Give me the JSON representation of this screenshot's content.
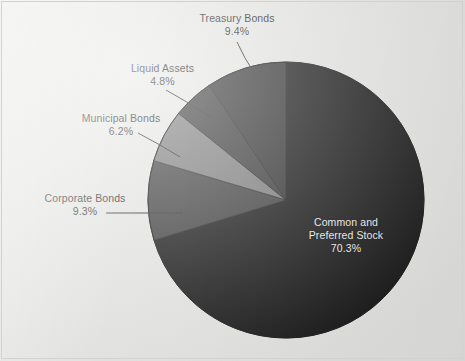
{
  "figure": {
    "background_color": "#e6e6e4",
    "border_color": "#d2d2d0",
    "width": 465,
    "height": 361
  },
  "chart_data": {
    "type": "pie",
    "title": "",
    "subtitle": "",
    "xlabel": "",
    "ylabel": "",
    "grid": false,
    "legend_position": "none",
    "label_format": "name + percent",
    "start_angle_deg": 90,
    "direction": "clockwise",
    "center": {
      "x": 286,
      "y": 200
    },
    "radius": 138,
    "categories": [
      "Common and Preferred Stock",
      "Corporate Bonds",
      "Municipal Bonds",
      "Liquid Assets",
      "Treasury Bonds"
    ],
    "values": [
      70.3,
      9.3,
      6.2,
      4.8,
      9.4
    ],
    "units": "percent",
    "total": 100.0,
    "slices": [
      {
        "label": "Common and Preferred Stock",
        "label_line1": "Common and",
        "label_line2": "Preferred Stock",
        "percent_text": "70.3%",
        "value": 70.3,
        "color": "#141414",
        "text_color": "#f2f2f2",
        "label_placement": "inside"
      },
      {
        "label": "Corporate Bonds",
        "percent_text": "9.3%",
        "value": 9.3,
        "color": "#3b3b3b",
        "text_color": "#1b1b1b",
        "label_placement": "outside-left"
      },
      {
        "label": "Municipal Bonds",
        "percent_text": "6.2%",
        "value": 6.2,
        "color": "#7a7a7a",
        "text_color": "#1b1b1b",
        "label_placement": "outside-left"
      },
      {
        "label": "Liquid Assets",
        "percent_text": "4.8%",
        "value": 4.8,
        "color": "#343434",
        "text_color": "#1b1b1b",
        "label_placement": "outside-upper-left"
      },
      {
        "label": "Treasury Bonds",
        "percent_text": "9.4%",
        "value": 9.4,
        "color": "#2d2d2d",
        "text_color": "#1b1b1b",
        "label_placement": "outside-top"
      }
    ]
  }
}
